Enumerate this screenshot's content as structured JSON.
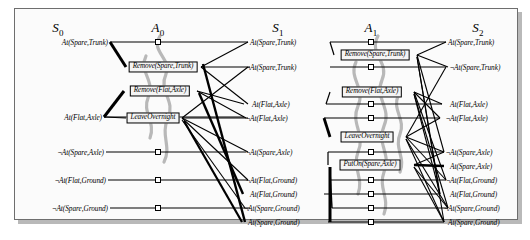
{
  "figure": {
    "columns": [
      {
        "key": "S0",
        "label": "S",
        "sub": "0",
        "x": 58
      },
      {
        "key": "A0",
        "label": "A",
        "sub": "0",
        "x": 158
      },
      {
        "key": "S1",
        "label": "S",
        "sub": "1",
        "x": 278
      },
      {
        "key": "A1",
        "label": "A",
        "sub": "1",
        "x": 371
      },
      {
        "key": "S2",
        "label": "S",
        "sub": "2",
        "x": 478
      }
    ],
    "levels": {
      "S0": {
        "name": "S0",
        "align": "right",
        "literals": [
          {
            "neg": "",
            "text": "At(Spare,Trunk)",
            "y": 42
          },
          {
            "neg": "",
            "text": "At(Flat,Axle)",
            "y": 117
          },
          {
            "neg": "¬",
            "text": "At(Spare,Axle)",
            "y": 152
          },
          {
            "neg": "¬",
            "text": "At(Flat,Ground)",
            "y": 180
          },
          {
            "neg": "¬",
            "text": "At(Spare,Ground)",
            "y": 208
          }
        ]
      },
      "A0": {
        "name": "A0",
        "noops_x": 158,
        "noops_y": [
          42,
          117,
          152,
          180,
          208
        ],
        "actions": [
          {
            "text": "Remove(Spare,Trunk)",
            "x": 163,
            "y": 67
          },
          {
            "text": "Remove(Flat,Axle)",
            "x": 160,
            "y": 91
          },
          {
            "text": "LeaveOvernight",
            "x": 153,
            "y": 118
          }
        ]
      },
      "S1": {
        "name": "S1",
        "align": "left",
        "literals": [
          {
            "neg": "",
            "text": "At(Spare,Trunk)",
            "y": 42
          },
          {
            "neg": "¬",
            "text": "At(Spare,Trunk)",
            "y": 67
          },
          {
            "neg": "",
            "text": "At(Flat,Axle)",
            "y": 104
          },
          {
            "neg": "¬",
            "text": "At(Flat,Axle)",
            "y": 118
          },
          {
            "neg": "¬",
            "text": "At(Spare,Axle)",
            "y": 152
          },
          {
            "neg": "¬",
            "text": "At(Flat,Ground)",
            "y": 180
          },
          {
            "neg": "",
            "text": "At(Flat,Ground)",
            "y": 194
          },
          {
            "neg": "¬",
            "text": "At(Spare,Ground)",
            "y": 208
          },
          {
            "neg": "",
            "text": "At(Spare,Ground)",
            "y": 222
          }
        ]
      },
      "A1": {
        "name": "A1",
        "noops_x": 371,
        "noops_y": [
          42,
          67,
          104,
          118,
          152,
          180,
          194,
          208,
          222
        ],
        "actions": [
          {
            "text": "Remove(Spare,Trunk)",
            "x": 375,
            "y": 55
          },
          {
            "text": "Remove(Flat,Axle)",
            "x": 372,
            "y": 92
          },
          {
            "text": "LeaveOvernight",
            "x": 367,
            "y": 137
          },
          {
            "text": "PutOn(Spare,Axle)",
            "x": 370,
            "y": 165
          }
        ]
      },
      "S2": {
        "name": "S2",
        "align": "left",
        "literals": [
          {
            "neg": "",
            "text": "At(Spare,Trunk)",
            "y": 42
          },
          {
            "neg": "¬",
            "text": "At(Spare,Trunk)",
            "y": 67
          },
          {
            "neg": "",
            "text": "At(Flat,Axle)",
            "y": 104
          },
          {
            "neg": "¬",
            "text": "At(Flat,Axle)",
            "y": 118
          },
          {
            "neg": "¬",
            "text": "At(Spare,Axle)",
            "y": 152
          },
          {
            "neg": "",
            "text": "At(Spare,Axle)",
            "y": 166
          },
          {
            "neg": "¬",
            "text": "At(Flat,Ground)",
            "y": 180
          },
          {
            "neg": "",
            "text": "At(Flat,Ground)",
            "y": 194
          },
          {
            "neg": "¬",
            "text": "At(Spare,Ground)",
            "y": 208
          },
          {
            "neg": "",
            "text": "At(Spare,Ground)",
            "y": 222
          }
        ]
      }
    },
    "colors": {
      "ink": "#000000",
      "mutex_curve": "#b8b8b8",
      "frame": "#6e6e6e",
      "paper": "#fbfbfb",
      "shadow": "#b9b9b9",
      "box_fill": "#f4f4f4"
    }
  }
}
